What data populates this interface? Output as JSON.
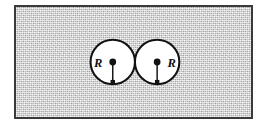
{
  "figure": {
    "caption": "",
    "background": {
      "fill_color": "#cfcfcf",
      "border_color": "#3a3a3a",
      "texture": "speckled-gray-halftone"
    },
    "shapes": {
      "circle_fill_color": "#ffffff",
      "circle_stroke_color": "#121212",
      "radius_line_color": "#121212",
      "center_dot_color": "#121212"
    },
    "circles": [
      {
        "id": "left-circle",
        "label": "R",
        "label_side": "left",
        "center_x": 112,
        "center_y": 62,
        "radius": 23
      },
      {
        "id": "right-circle",
        "label": "R",
        "label_side": "right",
        "center_x": 158,
        "center_y": 62,
        "radius": 23
      }
    ]
  }
}
